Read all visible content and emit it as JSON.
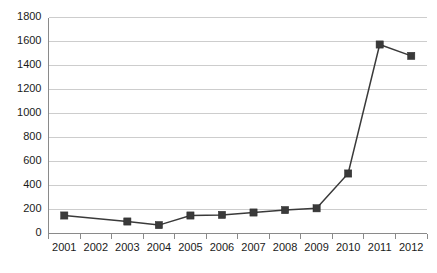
{
  "chart_data": {
    "type": "line",
    "title": "",
    "subtitle": "",
    "xlabel": "",
    "ylabel": "",
    "categories": [
      "2001",
      "2002",
      "2003",
      "2004",
      "2005",
      "2006",
      "2007",
      "2008",
      "2009",
      "2010",
      "2011",
      "2012"
    ],
    "values": [
      150,
      null,
      100,
      70,
      150,
      155,
      175,
      195,
      210,
      500,
      1575,
      1480
    ],
    "series": [
      {
        "name": "",
        "values": [
          150,
          null,
          100,
          70,
          150,
          155,
          175,
          195,
          210,
          500,
          1575,
          1480
        ]
      }
    ],
    "ylim": [
      0,
      1800
    ],
    "ytick_values": [
      0,
      200,
      400,
      600,
      800,
      1000,
      1200,
      1400,
      1600,
      1800
    ],
    "ytick_labels": [
      "0",
      "200",
      "400",
      "600",
      "800",
      "1000",
      "1200",
      "1400",
      "1600",
      "1800"
    ],
    "xtick_labels": [
      "2001",
      "2002",
      "2003",
      "2004",
      "2005",
      "2006",
      "2007",
      "2008",
      "2009",
      "2010",
      "2011",
      "2012"
    ],
    "grid": "horizontal",
    "legend": "none",
    "marker": "square",
    "colors": {
      "series": "#3a3a3a",
      "gridline": "#c8c8c8",
      "axis": "#8a8a8a",
      "text": "#1a1a1a",
      "background": "#ffffff"
    }
  }
}
